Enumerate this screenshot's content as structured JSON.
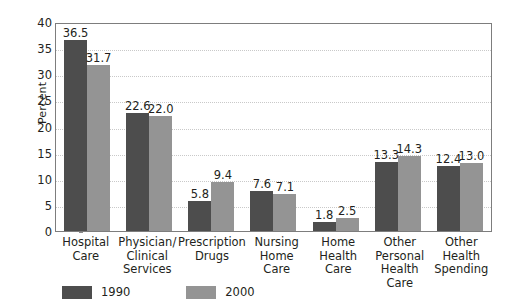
{
  "chart_data": {
    "type": "bar",
    "title": "",
    "subtitle": "",
    "xlabel": "",
    "ylabel": "Percent",
    "ylim": [
      0,
      40
    ],
    "yticks": [
      0,
      5,
      10,
      15,
      20,
      25,
      30,
      35,
      40
    ],
    "grid": true,
    "grid_style": "dotted horizontal",
    "legend_position": "bottom-left",
    "categories": [
      "Hospital Care",
      "Physician/ Clinical Services",
      "Prescription Drugs",
      "Nursing Home Care",
      "Home Health Care",
      "Other Personal Health Care",
      "Other Health Spending"
    ],
    "category_lines": [
      [
        "Hospital",
        "Care"
      ],
      [
        "Physician/",
        "Clinical",
        "Services"
      ],
      [
        "Prescription",
        "Drugs"
      ],
      [
        "Nursing",
        "Home",
        "Care"
      ],
      [
        "Home",
        "Health",
        "Care"
      ],
      [
        "Other",
        "Personal",
        "Health Care"
      ],
      [
        "Other Health",
        "Spending"
      ]
    ],
    "series": [
      {
        "name": "1990",
        "color": "#4d4d4d",
        "values": [
          36.5,
          22.6,
          5.8,
          7.6,
          1.8,
          13.3,
          12.4
        ],
        "labels": [
          "36.5",
          "22.6",
          "5.8",
          "7.6",
          "1.8",
          "13.3",
          "12.4"
        ]
      },
      {
        "name": "2000",
        "color": "#949494",
        "values": [
          31.7,
          22.0,
          9.4,
          7.1,
          2.5,
          14.3,
          13.0
        ],
        "labels": [
          "31.7",
          "22.0",
          "9.4",
          "7.1",
          "2.5",
          "14.3",
          "13.0"
        ]
      }
    ]
  },
  "legend": {
    "entries": [
      {
        "label": "1990",
        "color": "#4d4d4d"
      },
      {
        "label": "2000",
        "color": "#949494"
      }
    ]
  },
  "colors": {
    "series_1990": "#4d4d4d",
    "series_2000": "#949494",
    "axis": "#7d7d7d",
    "grid": "#c9c9c9",
    "text": "#231f20",
    "background": "#ffffff"
  }
}
